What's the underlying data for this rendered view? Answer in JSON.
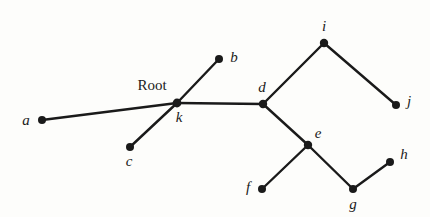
{
  "figure": {
    "type": "graph-diagram",
    "title": "",
    "background_color": "#fdfdfb",
    "stroke_color": "#1a1a1a",
    "node_color": "#1a1a1a"
  },
  "annotations": {
    "root_label": "Root",
    "root_label_x": 152,
    "root_label_y": 85
  },
  "chart_data": {
    "type": "diagram",
    "title": "",
    "nodes": [
      {
        "id": "a",
        "label": "a",
        "x": 42,
        "y": 120,
        "label_x": 26,
        "label_y": 120,
        "r": 4.0
      },
      {
        "id": "b",
        "label": "b",
        "x": 219,
        "y": 59,
        "label_x": 234,
        "label_y": 57,
        "r": 4.0
      },
      {
        "id": "c",
        "label": "c",
        "x": 130,
        "y": 147,
        "label_x": 129,
        "label_y": 161,
        "r": 4.0
      },
      {
        "id": "d",
        "label": "d",
        "x": 263,
        "y": 104,
        "label_x": 262,
        "label_y": 87,
        "r": 4.2
      },
      {
        "id": "e",
        "label": "e",
        "x": 308,
        "y": 145,
        "label_x": 318,
        "label_y": 133,
        "r": 4.2
      },
      {
        "id": "f",
        "label": "f",
        "x": 262,
        "y": 189,
        "label_x": 248,
        "label_y": 187,
        "r": 4.0
      },
      {
        "id": "g",
        "label": "g",
        "x": 353,
        "y": 189,
        "label_x": 353,
        "label_y": 204,
        "r": 4.0
      },
      {
        "id": "h",
        "label": "h",
        "x": 390,
        "y": 162,
        "label_x": 404,
        "label_y": 154,
        "r": 4.0
      },
      {
        "id": "i",
        "label": "i",
        "x": 324,
        "y": 43,
        "label_x": 324,
        "label_y": 26,
        "r": 4.2
      },
      {
        "id": "j",
        "label": "j",
        "x": 396,
        "y": 105,
        "label_x": 409,
        "label_y": 101,
        "r": 4.0
      },
      {
        "id": "k",
        "label": "k",
        "x": 177,
        "y": 103,
        "label_x": 179,
        "label_y": 117,
        "r": 4.4
      }
    ],
    "edges": [
      {
        "from": "a",
        "to": "k",
        "width": 2.4
      },
      {
        "from": "c",
        "to": "k",
        "width": 2.4
      },
      {
        "from": "k",
        "to": "b",
        "width": 2.4
      },
      {
        "from": "k",
        "to": "d",
        "width": 2.4
      },
      {
        "from": "d",
        "to": "i",
        "width": 2.4
      },
      {
        "from": "i",
        "to": "j",
        "width": 2.4
      },
      {
        "from": "d",
        "to": "e",
        "width": 2.4
      },
      {
        "from": "e",
        "to": "f",
        "width": 2.4
      },
      {
        "from": "e",
        "to": "g",
        "width": 2.4
      },
      {
        "from": "g",
        "to": "h",
        "width": 2.4
      }
    ]
  }
}
